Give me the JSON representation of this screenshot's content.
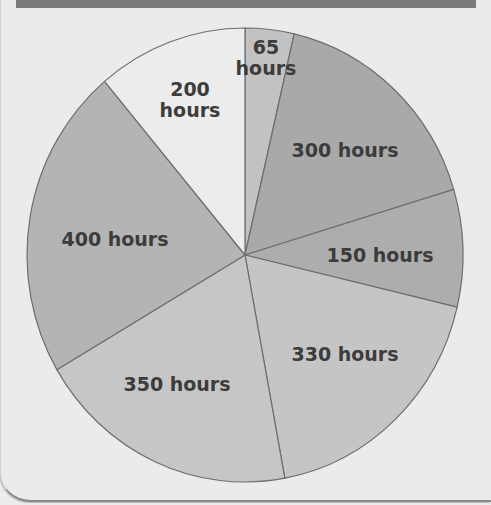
{
  "chart_data": {
    "type": "pie",
    "title": "",
    "start_angle_deg": 0,
    "direction": "clockwise",
    "unit": "hours",
    "slices": [
      {
        "label": "65 hours",
        "value": 65,
        "color": "#c2c2c2",
        "label_lines": [
          "65",
          "hours"
        ],
        "label_pos": [
          266,
          54
        ]
      },
      {
        "label": "300 hours",
        "value": 300,
        "color": "#a9a9a9",
        "label_lines": [
          "300 hours"
        ],
        "label_pos": [
          345,
          157
        ]
      },
      {
        "label": "150 hours",
        "value": 150,
        "color": "#adadad",
        "label_lines": [
          "150 hours"
        ],
        "label_pos": [
          380,
          262
        ]
      },
      {
        "label": "330 hours",
        "value": 330,
        "color": "#c5c5c5",
        "label_lines": [
          "330 hours"
        ],
        "label_pos": [
          345,
          361
        ]
      },
      {
        "label": "350 hours",
        "value": 350,
        "color": "#c6c6c6",
        "label_lines": [
          "350 hours"
        ],
        "label_pos": [
          177,
          391
        ]
      },
      {
        "label": "400 hours",
        "value": 400,
        "color": "#b4b4b4",
        "label_lines": [
          "400 hours"
        ],
        "label_pos": [
          115,
          246
        ]
      },
      {
        "label": "200 hours",
        "value": 200,
        "color": "#ececec",
        "label_lines": [
          "200",
          "hours"
        ],
        "label_pos": [
          190,
          96
        ]
      }
    ],
    "total": 1795
  },
  "layout": {
    "center": [
      245,
      255
    ],
    "rx": 218,
    "ry": 227,
    "stroke": "#6e6e6e"
  }
}
